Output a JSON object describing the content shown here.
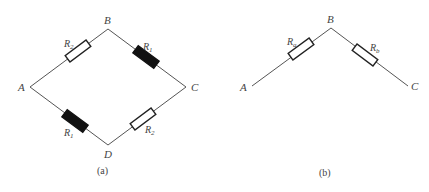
{
  "panels": [
    {
      "id": "a",
      "caption": "(a)",
      "nodes": {
        "A": "A",
        "B": "B",
        "C": "C",
        "D": "D"
      },
      "resistors": [
        {
          "position": "A-B",
          "label": "R",
          "sub": "2",
          "style": "hollow"
        },
        {
          "position": "B-C",
          "label": "R",
          "sub": "1",
          "style": "filled"
        },
        {
          "position": "A-D",
          "label": "R",
          "sub": "1",
          "style": "filled"
        },
        {
          "position": "D-C",
          "label": "R",
          "sub": "2",
          "style": "hollow"
        }
      ]
    },
    {
      "id": "b",
      "caption": "(b)",
      "nodes": {
        "A": "A",
        "B": "B",
        "C": "C"
      },
      "resistors": [
        {
          "position": "A-B",
          "label": "R",
          "sub": "a",
          "style": "hollow"
        },
        {
          "position": "B-C",
          "label": "R",
          "sub": "b",
          "style": "hollow"
        }
      ]
    }
  ]
}
